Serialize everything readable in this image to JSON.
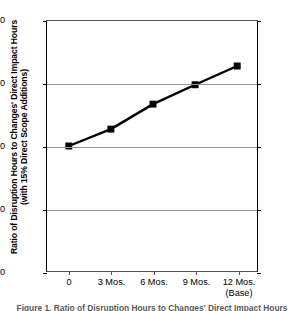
{
  "chart_data": {
    "type": "line",
    "title": "",
    "xlabel": "",
    "ylabel": "Ratio of Disruption Hours to Changes' Direct Impact Hours (with 15% Direct Scope Additions)",
    "ylabel_lines": [
      "Ratio of Disruption Hours to Changes' Direct Impact Hours",
      "(with 15% Direct Scope Additions)"
    ],
    "categories": [
      "0",
      "3 Mos.",
      "6 Mos.",
      "9 Mos.",
      "12 Mos."
    ],
    "category_sublabels": [
      "",
      "",
      "",
      "",
      "(Base)"
    ],
    "values": [
      2.0,
      2.27,
      2.67,
      2.98,
      3.28
    ],
    "ylim": [
      0.0,
      4.0
    ],
    "yticks": [
      "0.0",
      "1.0",
      "2.0",
      "3.0",
      "4.0"
    ],
    "ytick_values": [
      0.0,
      1.0,
      2.0,
      3.0,
      4.0
    ],
    "right_axis_yticks": [
      "0.0",
      "1.0",
      "2.0",
      "3.0",
      "4.0"
    ],
    "grid": true,
    "legend": null,
    "marker": "square",
    "line_color": "#000000",
    "marker_color": "#000000",
    "grid_color": "#9a9a9a",
    "axis_color": "#000000"
  },
  "caption": {
    "text": "Figure 1. Ratio of Disruption Hours to Changes' Direct Impact Hours"
  }
}
